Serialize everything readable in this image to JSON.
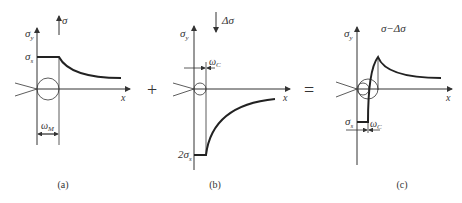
{
  "panels": [
    {
      "id": "a",
      "caption": "(a)",
      "applied_stress": "σ",
      "y_label": "σ",
      "y_sub": "y",
      "x_label": "x",
      "level_label": "σ",
      "level_sub": "s",
      "width_label": "ω",
      "width_sub": "M"
    },
    {
      "id": "b",
      "caption": "(b)",
      "applied_stress": "Δσ",
      "y_label": "σ",
      "y_sub": "y",
      "x_label": "x",
      "level_label": "2σ",
      "level_sub": "s",
      "width_label": "ω",
      "width_sub": "C"
    },
    {
      "id": "c",
      "caption": "(c)",
      "applied_stress": "σ−Δσ",
      "y_label": "σ",
      "y_sub": "y",
      "x_label": "x",
      "level_label": "σ",
      "level_sub": "s",
      "width_label": "ω",
      "width_sub": "C"
    }
  ],
  "operators": {
    "plus": "+",
    "equals": "="
  }
}
